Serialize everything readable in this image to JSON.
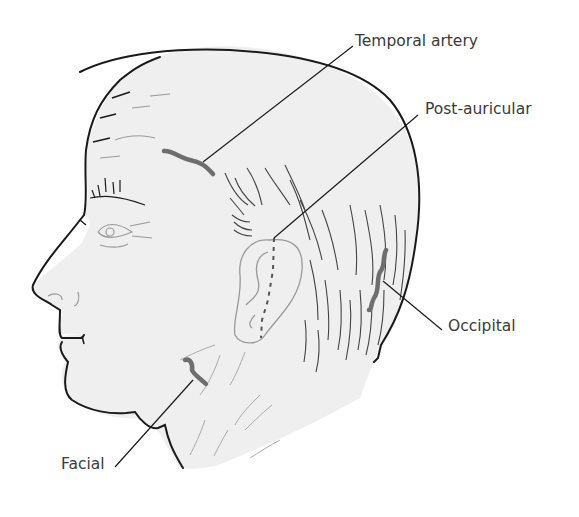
{
  "diagram": {
    "colors": {
      "skin_fill": "#efefef",
      "outline": "#1a1a1a",
      "hair_lines": "#555555",
      "artery": "#6e6e6e",
      "label_text": "#3a3a3a",
      "leader_line": "#1a1a1a"
    },
    "labels": [
      {
        "id": "temporal",
        "text": "Temporal artery"
      },
      {
        "id": "post_auricular",
        "text": "Post-auricular"
      },
      {
        "id": "occipital",
        "text": "Occipital"
      },
      {
        "id": "facial",
        "text": "Facial"
      }
    ]
  }
}
